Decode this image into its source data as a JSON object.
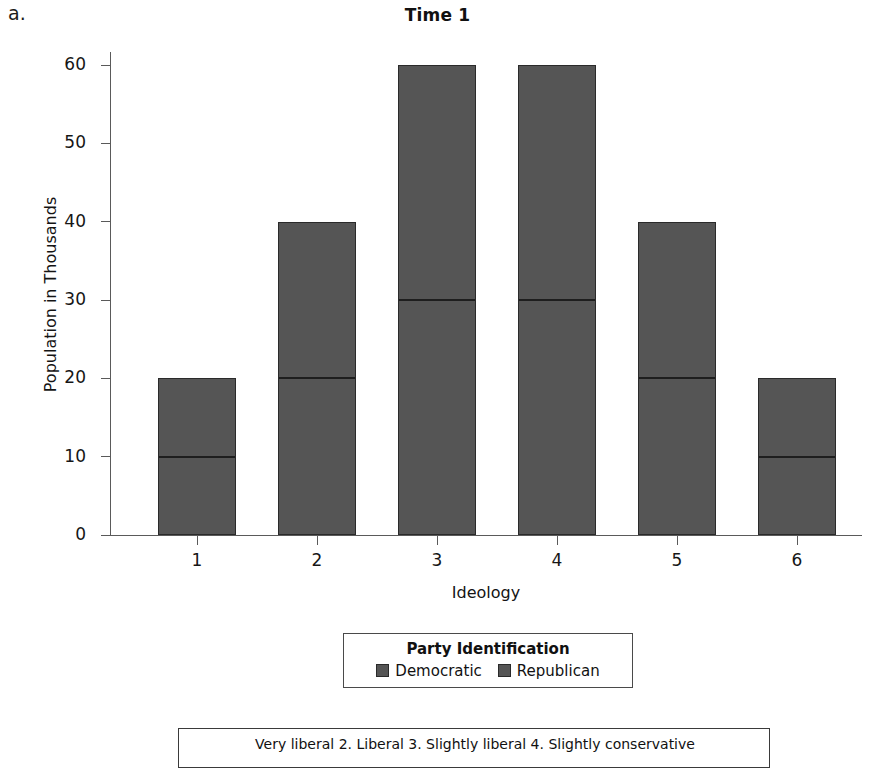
{
  "panel": {
    "letter": "a."
  },
  "chart_data": {
    "type": "bar",
    "subtype": "stacked",
    "title": "Time 1",
    "xlabel": "Ideology",
    "ylabel": "Population in Thousands",
    "categories": [
      "1",
      "2",
      "3",
      "4",
      "5",
      "6"
    ],
    "series": [
      {
        "name": "Democratic",
        "values": [
          10,
          20,
          30,
          30,
          20,
          10
        ]
      },
      {
        "name": "Republican",
        "values": [
          10,
          20,
          30,
          30,
          20,
          10
        ]
      }
    ],
    "totals": [
      20,
      40,
      60,
      60,
      40,
      20
    ],
    "ylim": [
      0,
      60
    ],
    "yticks": [
      0,
      10,
      20,
      30,
      40,
      50,
      60
    ],
    "ytick_labels": [
      "0",
      "10",
      "20",
      "30",
      "40",
      "50",
      "60"
    ],
    "xtick_labels": [
      "1",
      "2",
      "3",
      "4",
      "5",
      "6"
    ],
    "grid": false,
    "legend_position": "below-axes",
    "bar_color": "#555555",
    "bar_edge_color": "#2a2a2a"
  },
  "legend": {
    "title": "Party Identification",
    "items": [
      {
        "label": "Democratic",
        "color": "#555555"
      },
      {
        "label": "Republican",
        "color": "#555555"
      }
    ]
  },
  "caption": {
    "text": "Very liberal  2. Liberal  3. Slightly liberal  4. Slightly conservative"
  }
}
